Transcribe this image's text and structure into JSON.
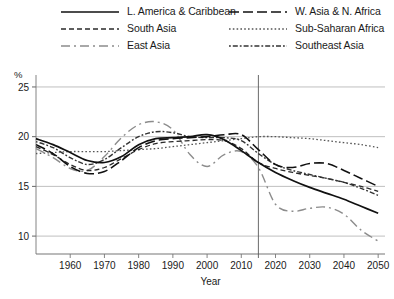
{
  "chart_data": {
    "type": "line",
    "title": "",
    "xlabel": "Year",
    "ylabel": "%",
    "unit_label": "%",
    "xlim": [
      1950,
      2052
    ],
    "ylim": [
      8.2,
      25.8
    ],
    "xticks": [
      1960,
      1970,
      1980,
      1990,
      2000,
      2010,
      2020,
      2030,
      2040,
      2050
    ],
    "xtick_labels": [
      "1960",
      "1970",
      "1980",
      "1990",
      "2000",
      "2010",
      "2020",
      "2030",
      "2040",
      "2050"
    ],
    "yticks": [
      10,
      15,
      20,
      25
    ],
    "ytick_labels": [
      "10",
      "15",
      "20",
      "25"
    ],
    "grid": "horizontal",
    "legend_position": "top",
    "projection_divider_year": 2015,
    "series": [
      {
        "name": "L. America & Caribbean",
        "style": "solid",
        "color": "#111111",
        "width": 1.7,
        "dasharray": "",
        "x": [
          1950,
          1955,
          1960,
          1965,
          1970,
          1975,
          1980,
          1985,
          1990,
          1995,
          2000,
          2005,
          2010,
          2015,
          2020,
          2025,
          2030,
          2035,
          2040,
          2045,
          2050
        ],
        "y": [
          19.8,
          19.2,
          18.4,
          17.6,
          17.4,
          18.0,
          19.2,
          19.8,
          19.9,
          20.0,
          20.2,
          19.7,
          18.6,
          17.4,
          16.4,
          15.6,
          14.9,
          14.3,
          13.7,
          13.0,
          12.3
        ]
      },
      {
        "name": "South Asia",
        "style": "dashed",
        "color": "#2a2a2a",
        "width": 1.3,
        "dasharray": "5,3",
        "x": [
          1950,
          1955,
          1960,
          1965,
          1970,
          1975,
          1980,
          1985,
          1990,
          1995,
          2000,
          2005,
          2010,
          2015,
          2020,
          2025,
          2030,
          2035,
          2040,
          2045,
          2050
        ],
        "y": [
          19.0,
          18.2,
          17.2,
          16.6,
          16.9,
          17.8,
          18.7,
          19.3,
          19.5,
          19.6,
          19.7,
          19.6,
          18.8,
          17.4,
          16.8,
          16.4,
          16.1,
          15.8,
          15.4,
          15.0,
          14.5
        ]
      },
      {
        "name": "East Asia",
        "style": "dashdot-long",
        "color": "#8c8c8c",
        "width": 1.4,
        "dasharray": "9,4,2,4",
        "x": [
          1950,
          1955,
          1960,
          1965,
          1970,
          1975,
          1980,
          1985,
          1990,
          1995,
          2000,
          2005,
          2010,
          2015,
          2020,
          2025,
          2030,
          2035,
          2040,
          2045,
          2050
        ],
        "y": [
          18.8,
          17.9,
          16.8,
          16.6,
          18.0,
          19.9,
          21.2,
          21.5,
          20.7,
          18.2,
          17.0,
          18.2,
          18.5,
          16.9,
          13.2,
          12.5,
          12.8,
          12.9,
          12.2,
          10.6,
          9.5
        ]
      },
      {
        "name": "W. Asia & N. Africa",
        "style": "long-dashed",
        "color": "#111111",
        "width": 1.6,
        "dasharray": "10,4",
        "x": [
          1950,
          1955,
          1960,
          1965,
          1970,
          1975,
          1980,
          1985,
          1990,
          1995,
          2000,
          2005,
          2010,
          2015,
          2020,
          2025,
          2030,
          2035,
          2040,
          2045,
          2050
        ],
        "y": [
          19.2,
          18.3,
          17.0,
          16.3,
          16.5,
          17.6,
          18.9,
          19.6,
          19.8,
          19.9,
          20.0,
          20.2,
          20.2,
          18.7,
          17.2,
          16.9,
          17.3,
          17.3,
          16.6,
          15.8,
          15.0
        ]
      },
      {
        "name": "Sub-Saharan Africa",
        "style": "dotted",
        "color": "#555555",
        "width": 1.3,
        "dasharray": "1.6,2.2",
        "x": [
          1950,
          1955,
          1960,
          1965,
          1970,
          1975,
          1980,
          1985,
          1990,
          1995,
          2000,
          2005,
          2010,
          2015,
          2020,
          2025,
          2030,
          2035,
          2040,
          2045,
          2050
        ],
        "y": [
          18.3,
          18.4,
          18.5,
          18.5,
          18.5,
          18.6,
          18.7,
          18.8,
          19.0,
          19.2,
          19.4,
          19.6,
          19.8,
          20.0,
          20.0,
          19.9,
          19.8,
          19.6,
          19.4,
          19.2,
          18.9
        ]
      },
      {
        "name": "Southeast Asia",
        "style": "dash-dotted-fine",
        "color": "#333333",
        "width": 1.4,
        "dasharray": "1.8,2,5,2",
        "x": [
          1950,
          1955,
          1960,
          1965,
          1970,
          1975,
          1980,
          1985,
          1990,
          1995,
          2000,
          2005,
          2010,
          2015,
          2020,
          2025,
          2030,
          2035,
          2040,
          2045,
          2050
        ],
        "y": [
          19.5,
          18.9,
          17.9,
          17.2,
          17.7,
          18.9,
          20.0,
          20.5,
          20.4,
          20.0,
          19.9,
          19.9,
          19.6,
          18.3,
          17.2,
          16.6,
          16.2,
          15.8,
          15.4,
          14.8,
          14.1
        ]
      }
    ]
  },
  "legend": {
    "items": [
      {
        "label": "L. America & Caribbean",
        "col": 0,
        "row": 0
      },
      {
        "label": "South Asia",
        "col": 0,
        "row": 1
      },
      {
        "label": "East Asia",
        "col": 0,
        "row": 2
      },
      {
        "label": "W. Asia & N. Africa",
        "col": 1,
        "row": 0
      },
      {
        "label": "Sub-Saharan Africa",
        "col": 1,
        "row": 1
      },
      {
        "label": "Southeast Asia",
        "col": 1,
        "row": 2
      }
    ]
  }
}
